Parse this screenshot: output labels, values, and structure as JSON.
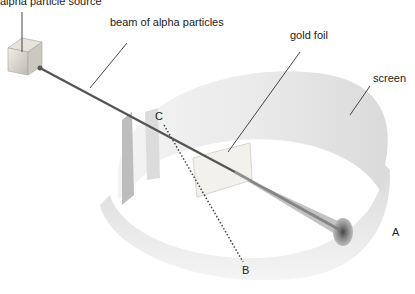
{
  "diagram": {
    "labels": {
      "source": "alpha particle source",
      "beam": "beam of alpha particles",
      "foil": "gold foil",
      "screen": "screen",
      "point_a": "A",
      "point_b": "B",
      "point_c": "C"
    },
    "colors": {
      "background": "#ffffff",
      "screen_fill": "#e4e4e4",
      "beam": "#555555",
      "leader_line": "#333333",
      "text": "#222222"
    }
  }
}
